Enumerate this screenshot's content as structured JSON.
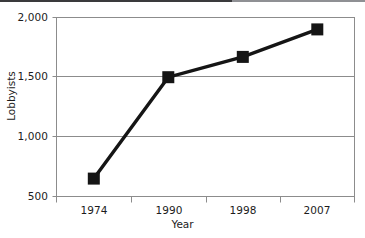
{
  "chart_data": {
    "type": "line",
    "title": "",
    "subtitle": "",
    "xlabel": "Year",
    "ylabel": "Lobbyists",
    "categories": [
      "1974",
      "1990",
      "1998",
      "2007"
    ],
    "values": [
      650,
      1500,
      1670,
      1900
    ],
    "series": [
      {
        "name": "Lobbyists",
        "values": [
          650,
          1500,
          1670,
          1900
        ]
      }
    ],
    "ylim": [
      500,
      2000
    ],
    "ytick_labels": [
      "500",
      "1,000",
      "1,500",
      "2,000"
    ],
    "ytick_values": [
      500,
      1000,
      1500,
      2000
    ],
    "xtick_labels": [
      "1974",
      "1990",
      "1998",
      "2007"
    ],
    "grid": "horizontal",
    "legend": "none",
    "marker": "filled-square",
    "line_color": "#151515",
    "marker_color": "#151515",
    "grid_color": "#8c8c8c",
    "frame_color": "#8c8c8c",
    "background_color": "#ffffff",
    "annotations": []
  },
  "axes": {
    "y_title": "Lobbyists",
    "x_title": "Year",
    "y_labels": {
      "t2000": "2,000",
      "t1500": "1,500",
      "t1000": "1,000",
      "t500": "500"
    },
    "x_labels": {
      "c0": "1974",
      "c1": "1990",
      "c2": "1998",
      "c3": "2007"
    }
  }
}
